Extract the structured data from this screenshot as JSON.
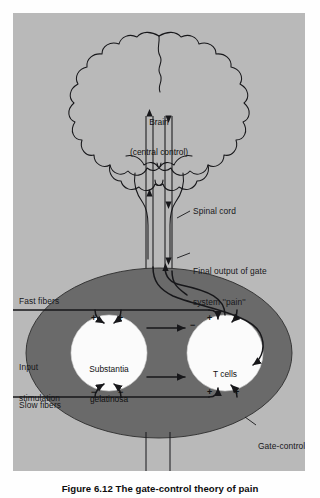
{
  "figure": {
    "caption": "Figure 6.12 The gate-control theory of pain",
    "background_color": "#b9b9b9",
    "page_color": "#fefefe",
    "ink_color": "#17171a",
    "gate_fill_color": "#6a6a6a",
    "node_fill_color": "#fbfbfb"
  },
  "diagram": {
    "type": "schematic-flow",
    "title": "The gate-control theory of pain",
    "nodes": [
      {
        "id": "brain",
        "label": "Brain\n(central control)",
        "shape": "ellipse",
        "fill": "#fbfbfb"
      },
      {
        "id": "sg",
        "label": "Substantia\ngelatinosa",
        "shape": "circle",
        "fill": "#fbfbfb"
      },
      {
        "id": "tcells",
        "label": "T cells",
        "shape": "circle",
        "fill": "#fbfbfb"
      },
      {
        "id": "gate",
        "label": "Gate-control\nsystem",
        "shape": "ellipse",
        "fill": "#6a6a6a"
      }
    ],
    "labels": {
      "brain_line1": "Brain",
      "brain_line2": "(central control)",
      "spinal_cord": "Spinal cord",
      "final_output_line1": "Final output of gate",
      "final_output_line2": "system ''pain''",
      "fast_fibers": "Fast fibers",
      "input_stimulation_line1": "Input",
      "input_stimulation_line2": "stimulation",
      "slow_fibers": "Slow fibers",
      "substantia_line1": "Substantia",
      "substantia_line2": "gelatinosa",
      "t_cells": "T cells",
      "gate_control_line1": "Gate-control",
      "gate_control_line2": "system"
    },
    "signs": {
      "sg_top_left": "+",
      "sg_top_right": "+",
      "sg_out_upper": "−",
      "sg_bottom_left": "−",
      "sg_bottom_right": "−",
      "t_top_left": "+",
      "t_top_right": "+",
      "t_bottom_left": "+",
      "t_bottom_right": "+"
    },
    "connections": [
      {
        "from": "fast-fibers-input",
        "to": "substantia-gelatinosa",
        "sign": "+"
      },
      {
        "from": "fast-fibers-input",
        "to": "t-cells",
        "sign": "+"
      },
      {
        "from": "slow-fibers-input",
        "to": "substantia-gelatinosa",
        "sign": "−"
      },
      {
        "from": "slow-fibers-input",
        "to": "t-cells",
        "sign": "+"
      },
      {
        "from": "substantia-gelatinosa",
        "to": "t-cells",
        "sign": "−"
      },
      {
        "from": "t-cells",
        "to": "brain",
        "via": "spinal-cord"
      },
      {
        "from": "brain",
        "to": "gate-control-system",
        "via": "spinal-cord"
      },
      {
        "from": "t-cells",
        "to": "final-output-pain"
      }
    ]
  }
}
